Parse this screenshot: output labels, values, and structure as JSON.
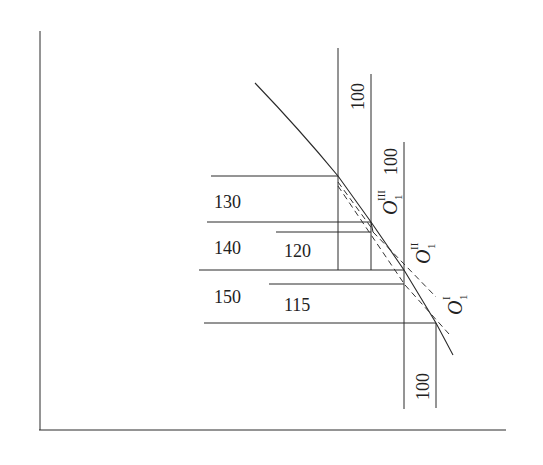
{
  "diagram": {
    "horizontal_labels": [
      {
        "id": "label-130",
        "text": "130",
        "x": 214,
        "y": 208
      },
      {
        "id": "label-140",
        "text": "140",
        "x": 214,
        "y": 254
      },
      {
        "id": "label-150",
        "text": "150",
        "x": 214,
        "y": 303
      },
      {
        "id": "label-120",
        "text": "120",
        "x": 284,
        "y": 257
      },
      {
        "id": "label-115",
        "text": "115",
        "x": 284,
        "y": 311
      }
    ],
    "vertical_labels": [
      {
        "id": "label-100-top",
        "text": "100",
        "x": 366,
        "y": 95
      },
      {
        "id": "label-100-mid",
        "text": "100",
        "x": 399,
        "y": 160
      },
      {
        "id": "label-100-bottom",
        "text": "100",
        "x": 431,
        "y": 378
      }
    ],
    "origin_labels": [
      {
        "id": "label-o1-iii",
        "main": "O",
        "sub": "1",
        "sup": "III"
      },
      {
        "id": "label-o1-ii",
        "main": "O",
        "sub": "1",
        "sup": "II"
      },
      {
        "id": "label-o1-i",
        "main": "O",
        "sub": "1",
        "sup": "I"
      }
    ]
  }
}
